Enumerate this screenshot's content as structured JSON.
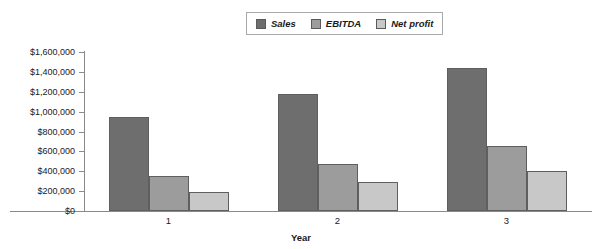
{
  "chart_data": {
    "type": "bar",
    "title": "",
    "subtitle": "",
    "xlabel": "Year",
    "ylabel": "",
    "categories": [
      "1",
      "2",
      "3"
    ],
    "series": [
      {
        "name": "Sales",
        "color": "#6e6e6e",
        "values": [
          950000,
          1180000,
          1440000
        ]
      },
      {
        "name": "EBITDA",
        "color": "#9c9c9c",
        "values": [
          350000,
          470000,
          650000
        ]
      },
      {
        "name": "Net profit",
        "color": "#c8c8c8",
        "values": [
          190000,
          295000,
          400000
        ]
      }
    ],
    "ylim": [
      0,
      1600000
    ],
    "ytick_values": [
      0,
      200000,
      400000,
      600000,
      800000,
      1000000,
      1200000,
      1400000,
      1600000
    ],
    "ytick_labels": [
      "$0",
      "$200,000",
      "$400,000",
      "$600,000",
      "$800,000",
      "$1,000,000",
      "$1,200,000",
      "$1,400,000",
      "$1,600,000"
    ],
    "grid": false,
    "legend_position": "top-center",
    "legend_entries": [
      "Sales",
      "EBITDA",
      "Net profit"
    ],
    "axis_color": "#8a8a8a",
    "bar_border_color": "#5f5f5f",
    "background": "#ffffff"
  }
}
